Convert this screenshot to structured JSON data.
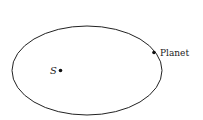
{
  "diagram": {
    "orbit_label": "Orbit",
    "focus_label": "S",
    "planet_label": "Planet",
    "colors": {
      "stroke": "#222222",
      "text": "#222222",
      "background": "#ffffff"
    }
  }
}
